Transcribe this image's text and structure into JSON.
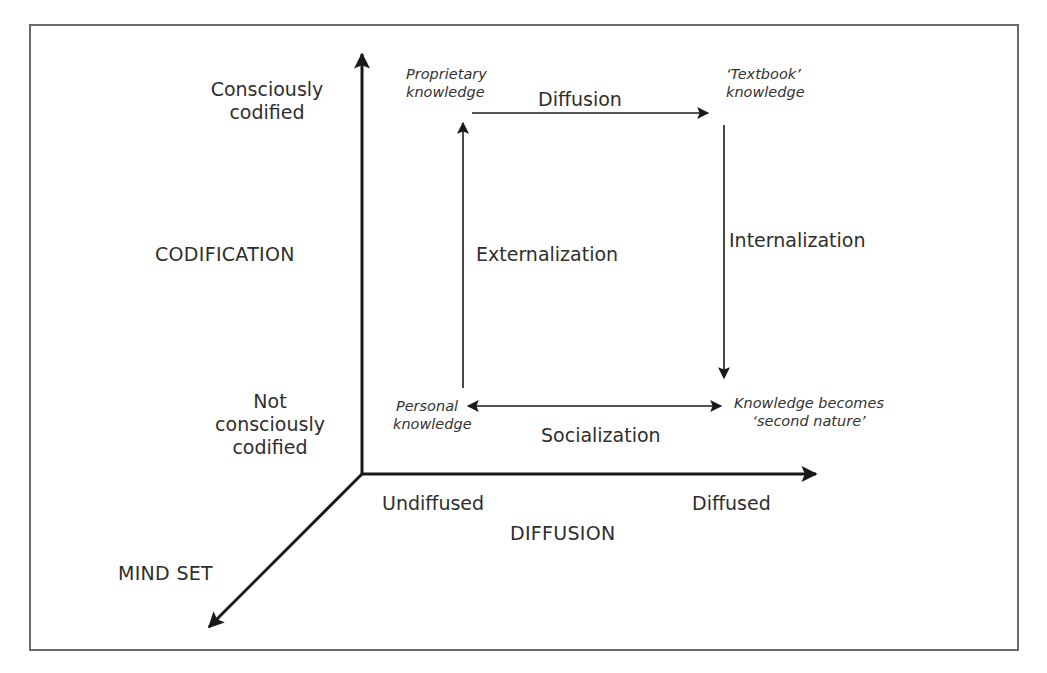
{
  "diagram": {
    "type": "knowledge-cycle-3d-axes",
    "axes": {
      "codification": {
        "title": "CODIFICATION",
        "high_label": "Consciously codified",
        "high_lines": [
          "Consciously",
          "codified"
        ],
        "low_label": "Not consciously codified",
        "low_lines": [
          "Not",
          "consciously",
          "codified"
        ]
      },
      "diffusion": {
        "title": "DIFFUSION",
        "low_label": "Undiffused",
        "high_label": "Diffused"
      },
      "mindset": {
        "title": "MIND SET"
      }
    },
    "nodes": {
      "proprietary": {
        "lines": [
          "Proprietary",
          "knowledge"
        ]
      },
      "textbook": {
        "lines": [
          "‘Textbook’",
          "knowledge"
        ]
      },
      "personal": {
        "lines": [
          "Personal",
          "knowledge"
        ]
      },
      "second_nature": {
        "lines": [
          "Knowledge becomes",
          "‘second nature’"
        ]
      }
    },
    "processes": {
      "diffusion": "Diffusion",
      "externalization": "Externalization",
      "internalization": "Internalization",
      "socialization": "Socialization"
    },
    "edges": [
      {
        "from": "personal",
        "to": "proprietary",
        "label": "Externalization",
        "direction": "up"
      },
      {
        "from": "proprietary",
        "to": "textbook",
        "label": "Diffusion",
        "direction": "right"
      },
      {
        "from": "textbook",
        "to": "second_nature",
        "label": "Internalization",
        "direction": "down"
      },
      {
        "from": "second_nature",
        "to": "personal",
        "label": "Socialization",
        "direction": "bidirectional"
      }
    ],
    "colors": {
      "line": "#1a1a1a",
      "frame": "#6a6a6a",
      "text": "#2e2e2e"
    }
  }
}
